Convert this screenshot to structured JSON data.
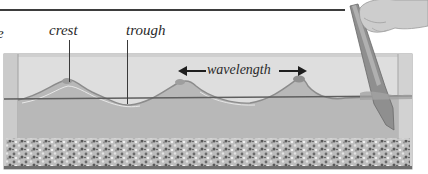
{
  "figure": {
    "labels": {
      "cut_off_text": "e",
      "crest": "crest",
      "trough": "trough",
      "wavelength": "wavelength"
    },
    "elements": {
      "tank": "glass water tank",
      "gravel": "gravel bed",
      "paddle": "paddle held by hand",
      "waterline": "still water level line"
    },
    "colors": {
      "rule": "#3d3d3d",
      "tank_glass": "#d9d9d9",
      "water": "#b9b9b9",
      "wave_surface": "#a8a8a8",
      "gravel_light": "#c8c8c8",
      "gravel_dark": "#5a5a5a",
      "paddle": "#8e8e8e",
      "hand": "#cfcfcf"
    }
  }
}
